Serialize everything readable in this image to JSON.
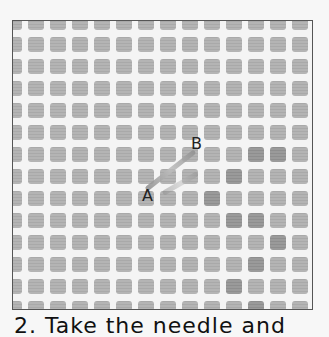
{
  "image": {
    "description": "Close-up photo of plastic canvas mesh with a diagonal stitch between points A and B",
    "labels": [
      {
        "id": "label-a",
        "text": "A",
        "x": 142,
        "y": 188
      },
      {
        "id": "label-b",
        "text": "B",
        "x": 191,
        "y": 136
      }
    ],
    "caption_partial": "2. Take the needle and"
  },
  "mesh": {
    "pitch": 22,
    "thread_color": "#f4f4f4",
    "hole_color": "#b0b0b0",
    "frame_color": "#555555"
  }
}
